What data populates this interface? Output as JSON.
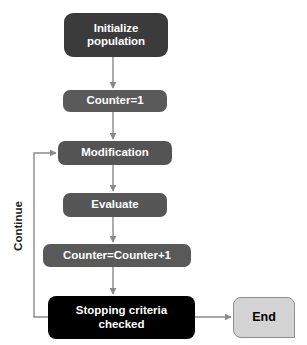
{
  "diagram": {
    "background": "#ffffff",
    "edge_color": "#808080",
    "nodes": {
      "initialize": {
        "label": "Initialize\npopulation",
        "fill": "#3b3b3b",
        "text_color": "#ffffff",
        "shape": "rounded-rect"
      },
      "counter_init": {
        "label": "Counter=1",
        "fill": "#5a5a5a",
        "text_color": "#ffffff",
        "shape": "rounded-rect"
      },
      "modification": {
        "label": "Modification",
        "fill": "#545454",
        "text_color": "#ffffff",
        "shape": "rounded-rect"
      },
      "evaluate": {
        "label": "Evaluate",
        "fill": "#565656",
        "text_color": "#ffffff",
        "shape": "rounded-rect"
      },
      "counter_increment": {
        "label": "Counter=Counter+1",
        "fill": "#595959",
        "text_color": "#ffffff",
        "shape": "rounded-rect"
      },
      "stopping": {
        "label": "Stopping criteria\nchecked",
        "fill": "#000000",
        "text_color": "#ffffff",
        "shape": "rounded-rect"
      },
      "end": {
        "label": "End",
        "fill": "#d4d4d4",
        "text_color": "#000000",
        "border": "#8c8c8c",
        "shape": "rounded-rect-notched"
      }
    },
    "edges": {
      "loop_back_label": "Continue"
    }
  }
}
